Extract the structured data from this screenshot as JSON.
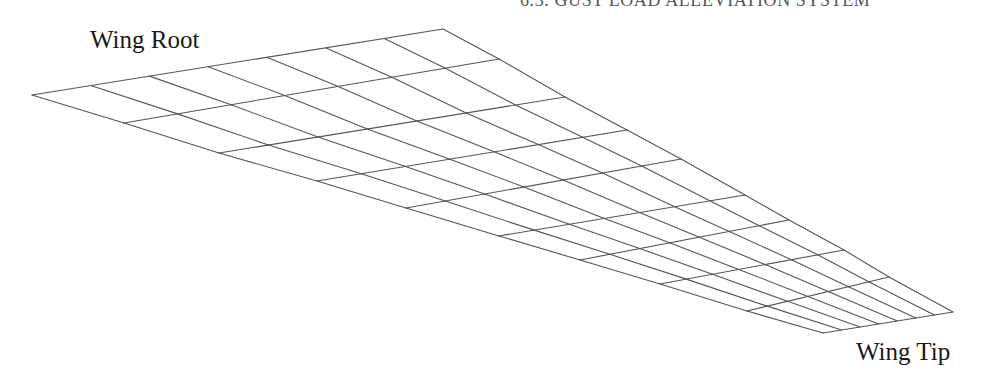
{
  "header": {
    "running_head": "6.3. GUST LOAD ALLEVIATION SYSTEM"
  },
  "figure": {
    "labels": {
      "root": "Wing Root",
      "tip": "Wing Tip"
    },
    "mesh": {
      "spanwise_divisions": 9,
      "chordwise_divisions": 7,
      "line_color": "#555555",
      "corners": {
        "root_leading": [
          32,
          95
        ],
        "root_trailing": [
          443,
          29
        ],
        "tip_leading": [
          823,
          333
        ],
        "tip_trailing": [
          953,
          312
        ]
      },
      "leading_edge_stations": [
        [
          32,
          95
        ],
        [
          124,
          123
        ],
        [
          219,
          153
        ],
        [
          317,
          181
        ],
        [
          406,
          208
        ],
        [
          499,
          236
        ],
        [
          580,
          260
        ],
        [
          660,
          284
        ],
        [
          747,
          311
        ],
        [
          823,
          333
        ]
      ],
      "trailing_edge_stations": [
        [
          443,
          29
        ],
        [
          499,
          59
        ],
        [
          565,
          97
        ],
        [
          627,
          130
        ],
        [
          681,
          159
        ],
        [
          745,
          195
        ],
        [
          789,
          220
        ],
        [
          844,
          250
        ],
        [
          889,
          277
        ],
        [
          953,
          312
        ]
      ]
    }
  }
}
